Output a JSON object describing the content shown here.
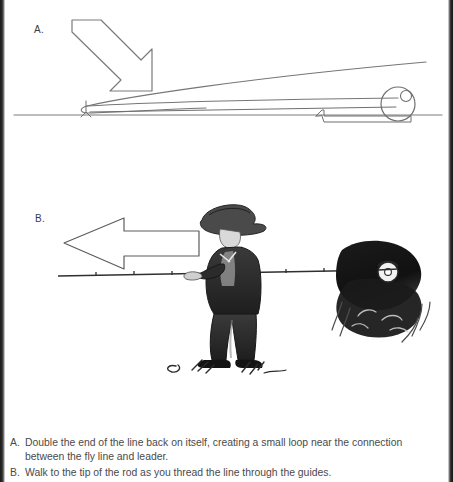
{
  "page": {
    "width": 453,
    "height": 482,
    "background": "#ffffff",
    "gutter_color": "#1a1a1a"
  },
  "panels": [
    {
      "id": "a",
      "label": "A.",
      "illustration_name": "fly-rod-line-loop-diagram",
      "description": "Line drawing of a fly rod lying horizontally with a reel at the right end; an outlined arrow points down-right at a small doubled loop of line near the rod tip at left, above a ground line.",
      "elements": {
        "arrow_direction": "down-right",
        "reel_position": "right",
        "loop_position": "left"
      }
    },
    {
      "id": "b",
      "label": "B.",
      "illustration_name": "angler-walking-rod-tip-sketch",
      "description": "Ink sketch of an angler in a wide-brimmed hat and vest holding a fly rod horizontally; a large outlined arrow points left above the rod, indicating walking toward the rod tip. A dark bush and the reel are at the right.",
      "elements": {
        "arrow_direction": "left",
        "figure": "angler-with-hat",
        "rod_orientation": "horizontal"
      }
    }
  ],
  "caption": {
    "items": [
      {
        "marker": "A.",
        "text": "Double the end of the line back on itself, creating a small loop near the connection between the fly line and leader."
      },
      {
        "marker": "B.",
        "text": "Walk to the tip of the rod as you thread the line through the guides."
      }
    ]
  },
  "colors": {
    "ink": "#4a4a4a",
    "line_art": "#6b6b6b",
    "sketch_dark": "#2a2a2a"
  }
}
